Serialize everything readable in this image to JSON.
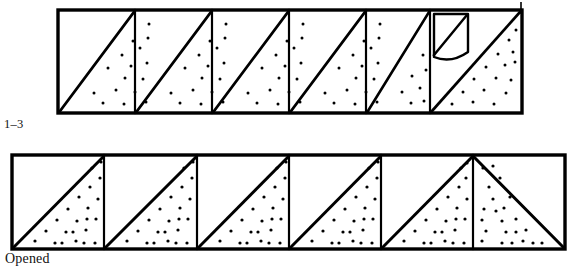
{
  "figure": {
    "kind": "line-illustration",
    "background_color": "#ffffff",
    "ink_color": "#000000",
    "stipple_color": "#000000"
  },
  "captions": {
    "top_label": "1–3",
    "bottom_label": "Opened"
  },
  "top_strip": {
    "name": "folded-strip",
    "x": 58,
    "y": 10,
    "width": 464,
    "height": 103,
    "cell_count": 6,
    "cell_width": 77.3,
    "diagonal_direction": "bottom-left-to-top-right",
    "stipple_side": "lower-right",
    "outline_weight": 3.2,
    "divider_weight": 2.2,
    "diagonal_weight": 2.6,
    "flap": {
      "name": "lifted-corner-flap",
      "present": true,
      "cell_index": 5,
      "curve_depth": 11
    },
    "edge_tick": {
      "name": "right-edge-tick",
      "x": 521,
      "y_top": 2,
      "y_bottom": 12
    }
  },
  "bottom_strip": {
    "name": "opened-strip",
    "x": 12,
    "y": 155,
    "width": 553,
    "height": 94,
    "cell_count": 6,
    "cell_width": 92.2,
    "diagonal_direction": "bottom-left-to-top-right",
    "last_cell_direction": "top-left-to-bottom-right",
    "stipple_side": "lower-right",
    "last_cell_stipple_side": "lower-left",
    "outline_weight": 3.2,
    "divider_weight": 2.2,
    "diagonal_weight": 3.0
  },
  "stipple_dots": {
    "top_strip_per_cell": 16,
    "bottom_strip_per_cell": 22,
    "dot_radius": 1.5
  }
}
